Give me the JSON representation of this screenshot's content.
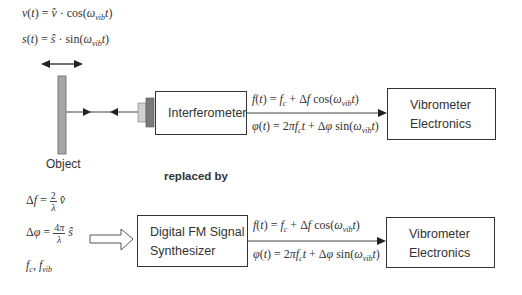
{
  "top_section": {
    "equation_velocity": "v(t) = v̂ · cos(ω_vib t)",
    "equation_displacement": "s(t) = ŝ · sin(ω_vib t)",
    "object_label": "Object",
    "interferometer_label": "Interferometer",
    "signal_frequency": "f(t) = f_c + Δf cos(ω_vib t)",
    "signal_phase": "φ(t) = 2πf_c t + Δφ sin(ω_vib t)",
    "vibrometer_line1": "Vibrometer",
    "vibrometer_line2": "Electronics"
  },
  "separator_label": "replaced by",
  "bottom_section": {
    "param_delta_f": "Δf = (2/λ) v̂",
    "param_delta_phi": "Δφ = (4π/λ) ŝ",
    "param_freqs": "f_c, f_vib",
    "synth_line1": "Digital FM Signal",
    "synth_line2": "Synthesizer",
    "signal_frequency": "f(t) = f_c + Δf cos(ω_vib t)",
    "signal_phase": "φ(t) = 2πf_c t + Δφ sin(ω_vib t)",
    "vibrometer_line1": "Vibrometer",
    "vibrometer_line2": "Electronics"
  },
  "colors": {
    "stroke": "#333333",
    "object_fill": "#a6a6a6",
    "lens_light": "#d0d0d0",
    "lens_dark": "#7a7a7a"
  }
}
